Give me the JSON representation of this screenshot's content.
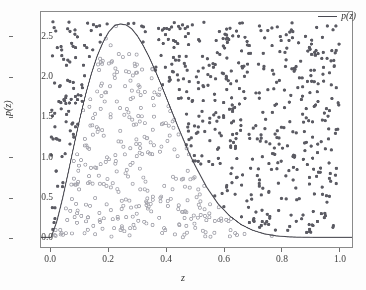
{
  "chart_data": {
    "type": "scatter",
    "title": "",
    "subtitle": "",
    "xlabel": "z",
    "ylabel": "p(z)",
    "xlim": [
      -0.035,
      1.045
    ],
    "ylim": [
      -0.12,
      2.82
    ],
    "xticks": [
      0.0,
      0.2,
      0.4,
      0.6,
      0.8,
      1.0
    ],
    "xticklabels": [
      "0.0",
      "0.2",
      "0.4",
      "0.6",
      "0.8",
      "1.0"
    ],
    "yticks": [
      0.0,
      0.5,
      1.0,
      1.5,
      2.0,
      2.5
    ],
    "yticklabels": [
      "0.0",
      "0.5",
      "1.0",
      "1.5",
      "2.0",
      "2.5"
    ],
    "grid": false,
    "legend": {
      "position": "upper-right",
      "entries": [
        {
          "label": "p(z)",
          "marker": "line",
          "color": "#4a4a52"
        }
      ]
    },
    "series": [
      {
        "name": "accepted-samples",
        "type": "scatter",
        "marker": "open-circle",
        "color": "#a8a8b0",
        "size": 3.1,
        "description": "samples below the density curve (accepted)",
        "count": 330,
        "region": "under-curve"
      },
      {
        "name": "rejected-samples",
        "type": "scatter",
        "marker": "filled-circle",
        "color": "#5b5b63",
        "size": 2.5,
        "description": "samples above the density curve (rejected)",
        "count": 560,
        "region": "above-curve"
      },
      {
        "name": "p(z)",
        "type": "line",
        "marker": "line",
        "color": "#4a4a52",
        "width": 1.1,
        "description": "beta-like probability density, peak ~2.67 at z~0.24",
        "distribution": "beta",
        "alpha": 2.3,
        "beta": 5.2,
        "peak_x": 0.24,
        "peak_y": 2.67,
        "points_x": [
          0.0,
          0.02,
          0.04,
          0.06,
          0.08,
          0.1,
          0.12,
          0.14,
          0.16,
          0.18,
          0.2,
          0.22,
          0.24,
          0.26,
          0.28,
          0.3,
          0.32,
          0.34,
          0.36,
          0.38,
          0.4,
          0.42,
          0.44,
          0.46,
          0.48,
          0.5,
          0.54,
          0.58,
          0.62,
          0.66,
          0.7,
          0.74,
          0.78,
          0.82,
          0.86,
          0.9,
          0.94,
          0.98,
          1.0
        ],
        "points_y": [
          0.0,
          0.2,
          0.49,
          0.82,
          1.16,
          1.49,
          1.79,
          2.05,
          2.27,
          2.44,
          2.57,
          2.65,
          2.67,
          2.66,
          2.61,
          2.52,
          2.4,
          2.26,
          2.1,
          1.93,
          1.75,
          1.57,
          1.39,
          1.22,
          1.05,
          0.9,
          0.63,
          0.42,
          0.27,
          0.16,
          0.09,
          0.045,
          0.02,
          0.008,
          0.003,
          0.001,
          0.0,
          0.0,
          0.0
        ],
        "envelope_max": 2.7
      }
    ],
    "accepted_points": {
      "x": [
        0.042,
        0.055,
        0.061,
        0.068,
        0.072,
        0.078,
        0.083,
        0.088,
        0.09,
        0.095,
        0.098,
        0.101,
        0.104,
        0.108,
        0.112,
        0.115,
        0.118,
        0.121,
        0.124,
        0.127,
        0.13,
        0.133,
        0.136,
        0.139,
        0.142,
        0.145,
        0.148,
        0.151,
        0.154,
        0.157,
        0.16,
        0.162,
        0.165,
        0.168,
        0.17,
        0.173,
        0.176,
        0.178,
        0.181,
        0.184,
        0.186,
        0.189,
        0.192,
        0.194,
        0.197,
        0.2,
        0.202,
        0.205,
        0.208,
        0.21,
        0.213,
        0.216,
        0.218,
        0.221,
        0.224,
        0.226,
        0.229,
        0.232,
        0.234,
        0.237,
        0.24,
        0.243,
        0.245,
        0.248,
        0.251,
        0.253,
        0.256,
        0.259,
        0.261,
        0.264,
        0.267,
        0.269,
        0.272,
        0.275,
        0.277,
        0.28,
        0.283,
        0.285,
        0.288,
        0.291,
        0.293,
        0.296,
        0.299,
        0.301,
        0.304,
        0.307,
        0.309,
        0.312,
        0.315,
        0.317,
        0.32,
        0.323,
        0.325,
        0.328,
        0.331,
        0.333,
        0.336,
        0.339,
        0.341,
        0.344,
        0.347,
        0.35,
        0.353,
        0.356,
        0.359,
        0.362,
        0.365,
        0.368,
        0.371,
        0.374,
        0.377,
        0.38,
        0.383,
        0.386,
        0.389,
        0.392,
        0.395,
        0.398,
        0.401,
        0.404,
        0.407,
        0.41,
        0.413,
        0.416,
        0.419,
        0.422,
        0.425,
        0.428,
        0.431,
        0.434,
        0.437,
        0.44,
        0.443,
        0.446,
        0.449,
        0.452,
        0.455,
        0.458,
        0.461,
        0.464,
        0.467,
        0.47,
        0.473,
        0.476,
        0.479,
        0.482,
        0.485,
        0.488,
        0.491,
        0.494,
        0.497,
        0.5,
        0.505,
        0.51,
        0.515,
        0.52,
        0.525,
        0.53,
        0.535,
        0.54,
        0.545,
        0.55,
        0.555,
        0.56,
        0.565,
        0.57,
        0.575,
        0.58,
        0.585,
        0.59,
        0.6,
        0.61,
        0.62,
        0.63,
        0.64,
        0.65
      ],
      "note": "y values sampled uniformly in [0, p(x)] — rendered procedurally"
    }
  },
  "axes": {
    "x": {
      "label": "z",
      "ticks": [
        {
          "value": 0.0,
          "label": "0.0"
        },
        {
          "value": 0.2,
          "label": "0.2"
        },
        {
          "value": 0.4,
          "label": "0.4"
        },
        {
          "value": 0.6,
          "label": "0.6"
        },
        {
          "value": 0.8,
          "label": "0.8"
        },
        {
          "value": 1.0,
          "label": "1.0"
        }
      ]
    },
    "y": {
      "label": "p(z)",
      "ticks": [
        {
          "value": 0.0,
          "label": "0.0"
        },
        {
          "value": 0.5,
          "label": "0.5"
        },
        {
          "value": 1.0,
          "label": "1.0"
        },
        {
          "value": 1.5,
          "label": "1.5"
        },
        {
          "value": 2.0,
          "label": "2.0"
        },
        {
          "value": 2.5,
          "label": "2.5"
        }
      ]
    }
  },
  "legend": {
    "entries": [
      {
        "label": "p(z)"
      }
    ]
  },
  "colors": {
    "curve": "#4a4a52",
    "rejected": "#5b5b63",
    "accepted": "#a8a8b0",
    "frame": "#8a8a8a",
    "text": "#2e2e2e",
    "background": "#ffffff"
  }
}
